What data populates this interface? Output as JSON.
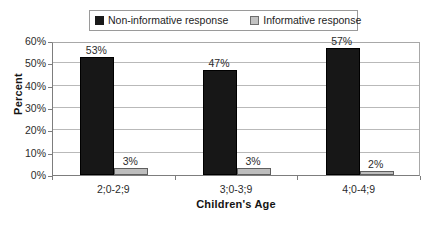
{
  "chart_data": {
    "type": "bar",
    "title": "",
    "subtitle": "",
    "xlabel": "Children's Age",
    "ylabel": "Percent",
    "categories": [
      "2;0-2;9",
      "3;0-3;9",
      "4;0-4;9"
    ],
    "series": [
      {
        "name": "Non-informative response",
        "color": "#171717",
        "values": [
          53,
          47,
          57
        ],
        "labels": [
          "53%",
          "47%",
          "57%"
        ]
      },
      {
        "name": "Informative response",
        "color": "#bdbdbd",
        "values": [
          3,
          3,
          2
        ],
        "labels": [
          "3%",
          "3%",
          "2%"
        ]
      }
    ],
    "ylim": [
      0,
      60
    ],
    "ytick_values": [
      0,
      10,
      20,
      30,
      40,
      50,
      60
    ],
    "ytick_labels": [
      "0%",
      "10%",
      "20%",
      "30%",
      "40%",
      "50%",
      "60%"
    ],
    "grid": "horizontal",
    "legend_position": "top-center",
    "value_suffix": "%"
  },
  "legend": {
    "entries": [
      {
        "label": "Non-informative response",
        "swatch": "dark-swatch-icon"
      },
      {
        "label": "Informative response",
        "swatch": "light-swatch-icon"
      }
    ]
  },
  "axes": {
    "y_title": "Percent",
    "x_title": "Children's Age",
    "y_ticks": [
      "60%",
      "50%",
      "40%",
      "30%",
      "20%",
      "10%",
      "0%"
    ],
    "x_ticks": [
      "2;0-2;9",
      "3;0-3;9",
      "4;0-4;9"
    ]
  },
  "bars": [
    {
      "group": "2;0-2;9",
      "series": "Non-informative response",
      "value": 53,
      "label": "53%"
    },
    {
      "group": "2;0-2;9",
      "series": "Informative response",
      "value": 3,
      "label": "3%"
    },
    {
      "group": "3;0-3;9",
      "series": "Non-informative response",
      "value": 47,
      "label": "47%"
    },
    {
      "group": "3;0-3;9",
      "series": "Informative response",
      "value": 3,
      "label": "3%"
    },
    {
      "group": "4;0-4;9",
      "series": "Non-informative response",
      "value": 57,
      "label": "57%"
    },
    {
      "group": "4;0-4;9",
      "series": "Informative response",
      "value": 2,
      "label": "2%"
    }
  ]
}
